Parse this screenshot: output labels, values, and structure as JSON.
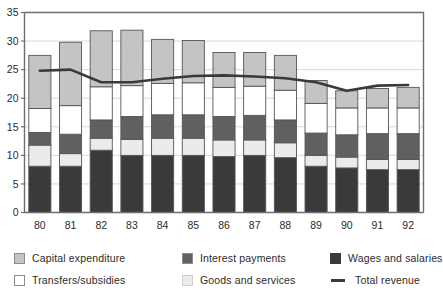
{
  "chart_data": {
    "type": "bar",
    "subtype": "stacked-bar-with-line-overlay",
    "title": "",
    "xlabel": "",
    "ylabel": "",
    "ylim": [
      0,
      35
    ],
    "ytick_step": 5,
    "yticks": [
      0,
      5,
      10,
      15,
      20,
      25,
      30,
      35
    ],
    "ytick_labels": [
      "0",
      "5",
      "10",
      "15",
      "20",
      "25",
      "30",
      "35"
    ],
    "grid": "horizontal",
    "legend_position": "bottom",
    "categories": [
      "80",
      "81",
      "82",
      "83",
      "84",
      "85",
      "86",
      "87",
      "88",
      "89",
      "90",
      "91",
      "92"
    ],
    "series": [
      {
        "name": "Wages and salaries",
        "color": "#3a3a3a",
        "values": [
          8.1,
          8.1,
          10.9,
          10.0,
          10.0,
          10.0,
          9.8,
          10.0,
          9.6,
          8.1,
          7.8,
          7.5,
          7.5
        ]
      },
      {
        "name": "Goods and services",
        "color": "#ebebeb",
        "values": [
          3.7,
          2.2,
          2.1,
          2.8,
          3.0,
          3.0,
          2.9,
          2.7,
          2.6,
          1.9,
          1.9,
          1.8,
          1.8
        ]
      },
      {
        "name": "Interest payments",
        "color": "#606060",
        "values": [
          2.2,
          3.4,
          3.2,
          4.0,
          4.1,
          4.1,
          4.1,
          4.3,
          4.0,
          3.9,
          3.9,
          4.5,
          4.5
        ]
      },
      {
        "name": "Transfers/subsidies",
        "color": "#ffffff",
        "values": [
          4.2,
          5.0,
          5.8,
          5.4,
          5.5,
          5.6,
          5.1,
          5.1,
          5.2,
          5.2,
          4.7,
          4.5,
          4.5
        ]
      },
      {
        "name": "Capital expenditure",
        "color": "#c4c4c4",
        "values": [
          9.3,
          11.1,
          9.8,
          9.7,
          7.7,
          7.4,
          6.1,
          5.9,
          6.1,
          4.0,
          3.0,
          3.4,
          3.6
        ]
      }
    ],
    "totals": [
      27.5,
      29.8,
      31.8,
      31.9,
      30.3,
      30.1,
      28.0,
      28.0,
      27.5,
      23.1,
      21.3,
      21.7,
      21.9
    ],
    "overlay_line": {
      "name": "Total revenue",
      "color": "#3a3a3a",
      "values": [
        24.8,
        25.0,
        22.8,
        22.8,
        23.4,
        23.9,
        24.0,
        23.8,
        23.5,
        22.8,
        21.3,
        22.2,
        22.3
      ]
    }
  },
  "legend": {
    "items": [
      {
        "label": "Capital expenditure",
        "swatch": "#c4c4c4",
        "type": "box"
      },
      {
        "label": "Interest payments",
        "swatch": "#606060",
        "type": "box"
      },
      {
        "label": "Wages and salaries",
        "swatch": "#3a3a3a",
        "type": "box"
      },
      {
        "label": "Transfers/subsidies",
        "swatch": "#ffffff",
        "type": "box"
      },
      {
        "label": "Goods and services",
        "swatch": "#ebebeb",
        "type": "box"
      },
      {
        "label": "Total revenue",
        "swatch": "#3a3a3a",
        "type": "line"
      }
    ]
  },
  "colors": {
    "axis": "#6e6e6e",
    "grid": "#d8d8d8",
    "bar_border": "#555555",
    "text": "#2b2b2b"
  }
}
